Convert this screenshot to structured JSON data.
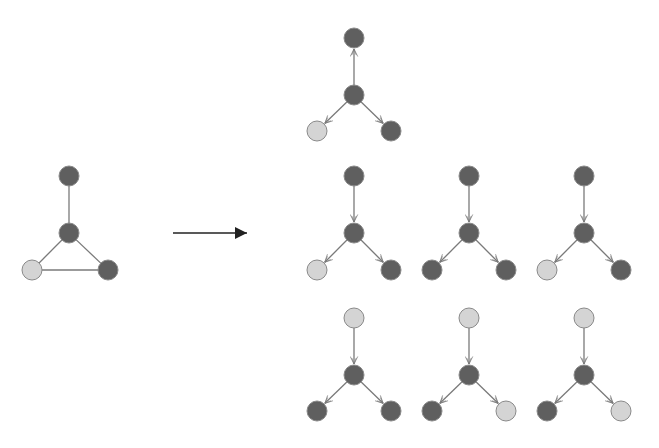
{
  "colors": {
    "dark_node": "#5f5f5f",
    "light_node": "#d4d4d4",
    "node_stroke": "#8a8a8a",
    "edge": "#7a7a7a",
    "main_arrow": "#222222",
    "background": "#ffffff"
  },
  "node_radius": 10,
  "input_graph": {
    "nodes": [
      {
        "id": "top",
        "x": 69,
        "y": 176,
        "shade": "dark"
      },
      {
        "id": "center",
        "x": 69,
        "y": 233,
        "shade": "dark"
      },
      {
        "id": "bottom-left",
        "x": 32,
        "y": 270,
        "shade": "light"
      },
      {
        "id": "bottom-right",
        "x": 108,
        "y": 270,
        "shade": "dark"
      }
    ],
    "edges": [
      [
        "top",
        "center"
      ],
      [
        "center",
        "bottom-left"
      ],
      [
        "center",
        "bottom-right"
      ],
      [
        "bottom-left",
        "bottom-right"
      ]
    ]
  },
  "transform_arrow": {
    "x1": 173,
    "y1": 233,
    "x2": 247,
    "y2": 233
  },
  "output_graphs": [
    {
      "cx": 354,
      "top_y": 38,
      "mid_y": 95,
      "bot_y": 131,
      "top_edge": "up",
      "shades": {
        "top": "dark",
        "center": "dark",
        "left": "light",
        "right": "dark"
      }
    },
    {
      "cx": 354,
      "top_y": 176,
      "mid_y": 233,
      "bot_y": 270,
      "top_edge": "down",
      "shades": {
        "top": "dark",
        "center": "dark",
        "left": "light",
        "right": "dark"
      }
    },
    {
      "cx": 469,
      "top_y": 176,
      "mid_y": 233,
      "bot_y": 270,
      "top_edge": "down",
      "shades": {
        "top": "dark",
        "center": "dark",
        "left": "dark",
        "right": "dark"
      }
    },
    {
      "cx": 584,
      "top_y": 176,
      "mid_y": 233,
      "bot_y": 270,
      "top_edge": "down",
      "shades": {
        "top": "dark",
        "center": "dark",
        "left": "light",
        "right": "dark"
      }
    },
    {
      "cx": 354,
      "top_y": 318,
      "mid_y": 375,
      "bot_y": 411,
      "top_edge": "down",
      "shades": {
        "top": "light",
        "center": "dark",
        "left": "dark",
        "right": "dark"
      }
    },
    {
      "cx": 469,
      "top_y": 318,
      "mid_y": 375,
      "bot_y": 411,
      "top_edge": "down",
      "shades": {
        "top": "light",
        "center": "dark",
        "left": "dark",
        "right": "light"
      }
    },
    {
      "cx": 584,
      "top_y": 318,
      "mid_y": 375,
      "bot_y": 411,
      "top_edge": "down",
      "shades": {
        "top": "light",
        "center": "dark",
        "left": "dark",
        "right": "light"
      }
    }
  ],
  "bottom_spread": 37
}
